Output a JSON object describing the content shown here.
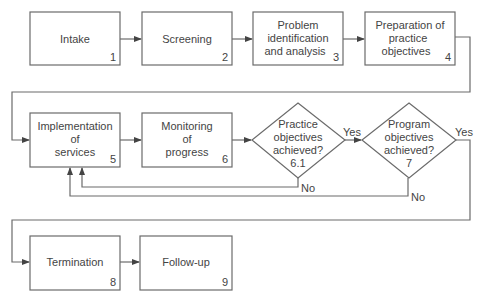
{
  "diagram": {
    "type": "flowchart",
    "nodes": [
      {
        "id": "1",
        "shape": "box",
        "lines": [
          "Intake"
        ],
        "number": "1"
      },
      {
        "id": "2",
        "shape": "box",
        "lines": [
          "Screening"
        ],
        "number": "2"
      },
      {
        "id": "3",
        "shape": "box",
        "lines": [
          "Problem",
          "identification",
          "and analysis"
        ],
        "number": "3"
      },
      {
        "id": "4",
        "shape": "box",
        "lines": [
          "Preparation of",
          "practice",
          "objectives"
        ],
        "number": "4"
      },
      {
        "id": "5",
        "shape": "box",
        "lines": [
          "Implementation",
          "of",
          "services"
        ],
        "number": "5"
      },
      {
        "id": "6",
        "shape": "box",
        "lines": [
          "Monitoring",
          "of",
          "progress"
        ],
        "number": "6"
      },
      {
        "id": "6.1",
        "shape": "diamond",
        "lines": [
          "Practice",
          "objectives",
          "achieved?",
          "6.1"
        ]
      },
      {
        "id": "7",
        "shape": "diamond",
        "lines": [
          "Program",
          "objectives",
          "achieved?",
          "7"
        ]
      },
      {
        "id": "8",
        "shape": "box",
        "lines": [
          "Termination"
        ],
        "number": "8"
      },
      {
        "id": "9",
        "shape": "box",
        "lines": [
          "Follow-up"
        ],
        "number": "9"
      }
    ],
    "edges": [
      {
        "from": "1",
        "to": "2",
        "label": ""
      },
      {
        "from": "2",
        "to": "3",
        "label": ""
      },
      {
        "from": "3",
        "to": "4",
        "label": ""
      },
      {
        "from": "4",
        "to": "5",
        "label": ""
      },
      {
        "from": "5",
        "to": "6",
        "label": ""
      },
      {
        "from": "6",
        "to": "6.1",
        "label": ""
      },
      {
        "from": "6.1",
        "to": "7",
        "label": "Yes"
      },
      {
        "from": "6.1",
        "to": "5",
        "label": "No"
      },
      {
        "from": "7",
        "to": "8",
        "label": "Yes"
      },
      {
        "from": "7",
        "to": "5",
        "label": "No"
      },
      {
        "from": "8",
        "to": "9",
        "label": ""
      }
    ],
    "edge_labels": {
      "yes": "Yes",
      "no": "No"
    },
    "colors": {
      "stroke": "#6b6b6b",
      "text": "#444444",
      "background": "#ffffff"
    }
  }
}
